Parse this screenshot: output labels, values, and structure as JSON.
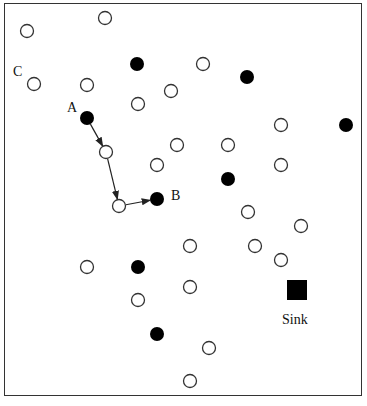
{
  "diagram": {
    "title": "",
    "labels": {
      "C": {
        "text": "C",
        "x": 13,
        "y": 65
      },
      "A": {
        "text": "A",
        "x": 67,
        "y": 101
      },
      "B": {
        "text": "B",
        "x": 171,
        "y": 189
      },
      "sink": {
        "text": "Sink",
        "x": 282,
        "y": 313
      }
    },
    "open_nodes": [
      [
        27,
        31
      ],
      [
        105,
        18
      ],
      [
        34,
        84
      ],
      [
        87,
        85
      ],
      [
        203,
        64
      ],
      [
        171,
        91
      ],
      [
        138,
        104
      ],
      [
        281,
        125
      ],
      [
        106,
        152
      ],
      [
        177,
        145
      ],
      [
        228,
        145
      ],
      [
        157,
        165
      ],
      [
        281,
        165
      ],
      [
        119,
        206
      ],
      [
        248,
        212
      ],
      [
        301,
        226
      ],
      [
        190,
        246
      ],
      [
        255,
        246
      ],
      [
        281,
        260
      ],
      [
        87,
        267
      ],
      [
        190,
        287
      ],
      [
        138,
        300
      ],
      [
        209,
        348
      ],
      [
        190,
        381
      ]
    ],
    "filled_nodes": [
      [
        137,
        64
      ],
      [
        247,
        77
      ],
      [
        346,
        125
      ],
      [
        87,
        118
      ],
      [
        157,
        199
      ],
      [
        228,
        179
      ],
      [
        138,
        267
      ],
      [
        157,
        334
      ]
    ],
    "sink": {
      "x": 297,
      "y": 290,
      "size": 20
    },
    "path_edges": [
      [
        [
          87,
          118
        ],
        [
          106,
          152
        ]
      ],
      [
        [
          106,
          152
        ],
        [
          119,
          206
        ]
      ],
      [
        [
          119,
          206
        ],
        [
          157,
          199
        ]
      ]
    ],
    "colors": {
      "node_stroke": "#333333",
      "filled": "#000000",
      "edge": "#222222"
    }
  }
}
